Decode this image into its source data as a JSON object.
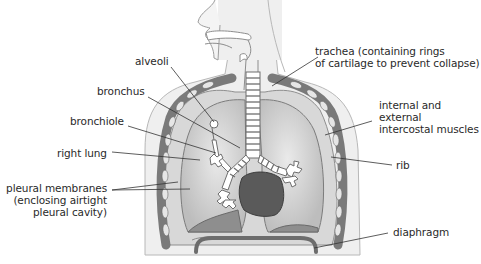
{
  "diagram": {
    "labels": {
      "alveoli": "alveoli",
      "bronchus": "bronchus",
      "bronchiole": "bronchiole",
      "right_lung": "right lung",
      "pleural_line1": "pleural membranes",
      "pleural_line2": "(enclosing airtight",
      "pleural_line3": "pleural cavity)",
      "trachea_line1": "trachea (containing rings",
      "trachea_line2": "of cartilage to prevent collapse)",
      "intercostal_line1": "internal and",
      "intercostal_line2": "external",
      "intercostal_line3": "intercostal muscles",
      "rib": "rib",
      "diaphragm": "diaphragm"
    },
    "colors": {
      "background": "#ffffff",
      "body_fill": "#eeeeee",
      "body_outline": "#b5b5b5",
      "lung_fill": "#c9c9c9",
      "lung_inner": "#dcdcdc",
      "rib_fill": "#8a8a8a",
      "rib_hole": "#e6e6e6",
      "heart_fill": "#555555",
      "leader_line": "#333333",
      "text": "#2a2a2a"
    }
  }
}
